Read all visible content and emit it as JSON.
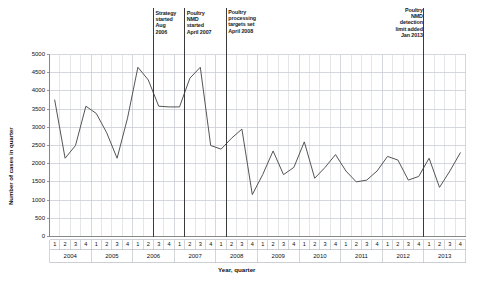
{
  "chart_data": {
    "type": "line",
    "title": "",
    "xlabel": "Year, quarter",
    "ylabel": "Number of cases in quarter",
    "ylim": [
      0,
      5000
    ],
    "ytick_labels": [
      "0",
      "500",
      "1000",
      "1500",
      "2000",
      "2500",
      "3000",
      "3500",
      "4000",
      "4500",
      "5000"
    ],
    "ytick_values": [
      0,
      500,
      1000,
      1500,
      2000,
      2500,
      3000,
      3500,
      4000,
      4500,
      5000
    ],
    "grid": true,
    "legend": "none",
    "years": [
      "2004",
      "2005",
      "2006",
      "2007",
      "2008",
      "2009",
      "2010",
      "2011",
      "2012",
      "2013"
    ],
    "quarter_labels": [
      "1",
      "2",
      "3",
      "4"
    ],
    "categories": [
      "2004 Q1",
      "2004 Q2",
      "2004 Q3",
      "2004 Q4",
      "2005 Q1",
      "2005 Q2",
      "2005 Q3",
      "2005 Q4",
      "2006 Q1",
      "2006 Q2",
      "2006 Q3",
      "2006 Q4",
      "2007 Q1",
      "2007 Q2",
      "2007 Q3",
      "2007 Q4",
      "2008 Q1",
      "2008 Q2",
      "2008 Q3",
      "2008 Q4",
      "2009 Q1",
      "2009 Q2",
      "2009 Q3",
      "2009 Q4",
      "2010 Q1",
      "2010 Q2",
      "2010 Q3",
      "2010 Q4",
      "2011 Q1",
      "2011 Q2",
      "2011 Q3",
      "2011 Q4",
      "2012 Q1",
      "2012 Q2",
      "2012 Q3",
      "2012 Q4",
      "2013 Q1",
      "2013 Q2",
      "2013 Q3",
      "2013 Q4"
    ],
    "values": [
      3750,
      2150,
      2500,
      3580,
      3380,
      2850,
      2150,
      3250,
      4650,
      4300,
      3580,
      3560,
      3560,
      4350,
      4650,
      2500,
      2400,
      2700,
      2950,
      1150,
      1700,
      2350,
      1700,
      1900,
      2600,
      1600,
      1900,
      2250,
      1800,
      1500,
      1550,
      1800,
      2200,
      2100,
      1550,
      1650,
      2150,
      1350,
      1800,
      2300
    ],
    "series_color": "#555555",
    "event_markers": [
      {
        "id": "strategy-started",
        "label": "Strategy\nstarted\nAug\n2006",
        "quarter_index": 10
      },
      {
        "id": "poultry-nmd-started",
        "label": "Poultry\nNMD\nstarted\nApril 2007",
        "quarter_index": 13
      },
      {
        "id": "poultry-processing-targets",
        "label": "Poultry\nprocessing\ntargets set\nApril 2008",
        "quarter_index": 17
      },
      {
        "id": "poultry-nmd-detection-limit",
        "label": "Poultry\nNMD\ndetection\nlimit added\nJan 2013",
        "quarter_index": 36
      }
    ],
    "event_marker_color": "#3a3a3a",
    "grid_color": "#c9cdd4",
    "axis_color": "#808080"
  }
}
